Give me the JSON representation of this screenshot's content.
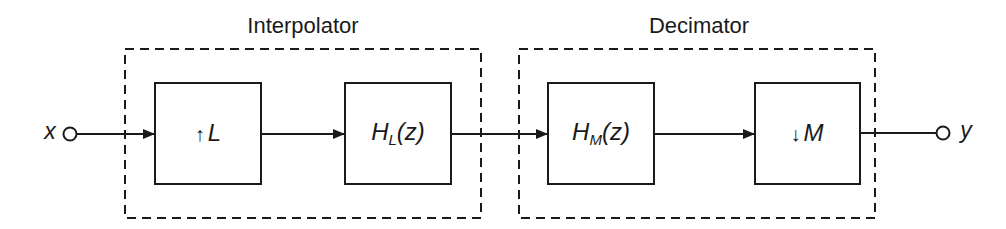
{
  "diagram": {
    "type": "block-diagram",
    "groups": [
      {
        "id": "interpolator",
        "title": "Interpolator"
      },
      {
        "id": "decimator",
        "title": "Decimator"
      }
    ],
    "input": {
      "label": "x"
    },
    "output": {
      "label": "y"
    },
    "blocks": [
      {
        "id": "upsampler",
        "arrow": "↑",
        "symbol": "L",
        "group": "interpolator"
      },
      {
        "id": "interp-filter",
        "base": "H",
        "sub": "L",
        "arg": "(z)",
        "group": "interpolator"
      },
      {
        "id": "decim-filter",
        "base": "H",
        "sub": "M",
        "arg": "(z)",
        "group": "decimator"
      },
      {
        "id": "downsampler",
        "arrow": "↓",
        "symbol": "M",
        "group": "decimator"
      }
    ],
    "connections": [
      [
        "x",
        "upsampler"
      ],
      [
        "upsampler",
        "interp-filter"
      ],
      [
        "interp-filter",
        "decim-filter"
      ],
      [
        "decim-filter",
        "downsampler"
      ],
      [
        "downsampler",
        "y"
      ]
    ]
  }
}
